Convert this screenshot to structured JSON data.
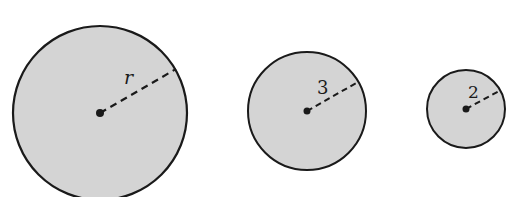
{
  "diagram": {
    "fill_color": "#d4d4d4",
    "stroke_color": "#1a1a1a",
    "circles": [
      {
        "label": "r",
        "italic": true,
        "cx": 100,
        "cy": 113,
        "radius": 87,
        "end_x": 176,
        "end_y": 69,
        "label_x": 124,
        "label_y": 84,
        "font_size": 19
      },
      {
        "label": "3",
        "italic": false,
        "cx": 307,
        "cy": 111,
        "radius": 59,
        "end_x": 358,
        "end_y": 82,
        "label_x": 317,
        "label_y": 94,
        "font_size": 18
      },
      {
        "label": "2",
        "italic": false,
        "cx": 466,
        "cy": 109,
        "radius": 39,
        "end_x": 499,
        "end_y": 91,
        "label_x": 468,
        "label_y": 98,
        "font_size": 17
      }
    ]
  }
}
